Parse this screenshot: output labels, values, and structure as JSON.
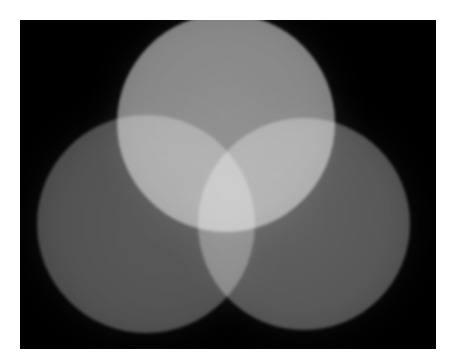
{
  "image": {
    "description": "Three overlapping grayscale circles of light on a black background, additive brightness at overlaps",
    "background_color": "#000000",
    "page_color": "#ffffff",
    "circles": [
      {
        "name": "top",
        "cx": 206,
        "cy": 103,
        "r": 109,
        "color": "#7a7a7a"
      },
      {
        "name": "left",
        "cx": 126,
        "cy": 204,
        "r": 109,
        "color": "#494949"
      },
      {
        "name": "right",
        "cx": 284,
        "cy": 204,
        "r": 106,
        "color": "#505050"
      }
    ]
  }
}
